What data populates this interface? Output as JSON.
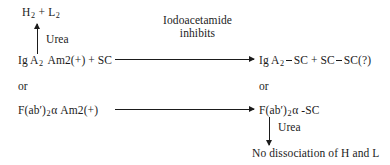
{
  "diagram": {
    "title_text": "Iodoacetamide inhibits reaction scheme",
    "nodes": {
      "products_top_left": {
        "label": "H2 + L2",
        "parts": [
          "H",
          "2",
          " + L",
          "2"
        ]
      },
      "reactant_primary": {
        "label": "Ig A2 Am2(+) + SC",
        "prefix": "Ig A",
        "subscript": "2",
        "suffix": " Am2(+) + SC"
      },
      "or_left": {
        "label": "or"
      },
      "reactant_alternate": {
        "label": "F(ab')2α Am2(+)",
        "prefix": "F(ab′)",
        "subscript": "2",
        "suffix": "α Am2(+)"
      },
      "product_primary": {
        "label": "Ig A2—SC + SC—SC(?)",
        "prefix": "Ig A",
        "subscript": "2",
        "mid": "SC + SC",
        "suffix": "SC(?)"
      },
      "or_right": {
        "label": "or"
      },
      "product_alternate": {
        "label": "F(ab')2α-SC",
        "prefix": "F(ab′)",
        "subscript": "2",
        "suffix": "α -SC"
      },
      "final_result": {
        "label": "No dissociation of H and L"
      }
    },
    "arrow_labels": {
      "condition_top": {
        "line1": "Iodoacetamide",
        "line2": "inhibits"
      },
      "urea_left": {
        "label": "Urea"
      },
      "urea_right": {
        "label": "Urea"
      }
    },
    "arrows": [
      {
        "name": "urea-up-arrow",
        "direction": "up"
      },
      {
        "name": "main-reaction-arrow",
        "direction": "right"
      },
      {
        "name": "alternate-reaction-arrow",
        "direction": "right"
      },
      {
        "name": "urea-down-arrow",
        "direction": "down"
      }
    ],
    "colors": {
      "ink": "#1b1b1b",
      "background": "#ffffff"
    }
  }
}
